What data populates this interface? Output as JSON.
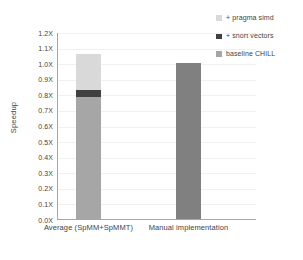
{
  "chart_data": {
    "type": "bar",
    "subtype": "stacked-bar",
    "title": "",
    "xlabel": "",
    "ylabel": "Speedup",
    "ylim": [
      0.0,
      1.2
    ],
    "ytick_labels": [
      "1.2X",
      "1.1X",
      "1.0X",
      "0.9X",
      "0.8X",
      "0.7X",
      "0.6X",
      "0.5X",
      "0.4X",
      "0.3X",
      "0.2X",
      "0.1X",
      "0.0X"
    ],
    "ytick_values": [
      1.2,
      1.1,
      1.0,
      0.9,
      0.8,
      0.7,
      0.6,
      0.5,
      0.4,
      0.3,
      0.2,
      0.1,
      0.0
    ],
    "grid": true,
    "legend_position": "top-right",
    "categories": [
      "Average (SpMM+SpMMT)",
      "Manual implementation"
    ],
    "series": [
      {
        "name": "baseline CHILL",
        "color": "#a6a6a6",
        "values": [
          0.78,
          1.0
        ]
      },
      {
        "name": "+ short vectors",
        "color": "#404040",
        "values": [
          0.05,
          0.0
        ]
      },
      {
        "name": "+ pragma simd",
        "color": "#d9d9d9",
        "values": [
          0.23,
          0.0
        ]
      }
    ],
    "bar_totals": [
      1.06,
      1.0
    ],
    "legend_entries": [
      {
        "label": "+ pragma simd",
        "color": "#d9d9d9"
      },
      {
        "label": "+ short vectors",
        "color": "#404040"
      },
      {
        "label": "baseline CHILL",
        "color": "#a6a6a6"
      }
    ],
    "bar2_color": "#808080"
  }
}
